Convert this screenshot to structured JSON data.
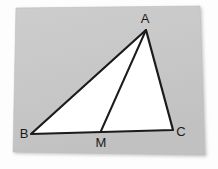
{
  "figure": {
    "kind": "geometry-diagram",
    "canvas": {
      "width": 218,
      "height": 169
    },
    "colors": {
      "page_background": "#fdfdfd",
      "paper_background": "#c9c9c9",
      "paper_shadow": "#b5b5b5",
      "triangle_fill": "#ffffff",
      "stroke": "#1a1a1a",
      "label_color": "#1a1a1a"
    },
    "paper": {
      "name": "paper-sheet",
      "points": "16,8 200,6 205,155 13,152"
    },
    "triangle": {
      "name": "triangle-abc",
      "points": "146,30 31,134 173,130",
      "fill": "#ffffff",
      "stroke_width": 2.2
    },
    "cevian": {
      "name": "segment-am",
      "from": {
        "x": 146,
        "y": 30
      },
      "to": {
        "x": 101,
        "y": 131
      },
      "stroke_width": 2.0
    },
    "vertices": [
      {
        "id": "A",
        "label": "A",
        "point_x": 146,
        "point_y": 30,
        "label_x": 145,
        "label_y": 23
      },
      {
        "id": "B",
        "label": "B",
        "point_x": 31,
        "point_y": 134,
        "label_x": 24,
        "label_y": 138
      },
      {
        "id": "M",
        "label": "M",
        "point_x": 101,
        "point_y": 131,
        "label_x": 101,
        "label_y": 147
      },
      {
        "id": "C",
        "label": "C",
        "point_x": 173,
        "point_y": 130,
        "label_x": 181,
        "label_y": 136
      }
    ]
  }
}
